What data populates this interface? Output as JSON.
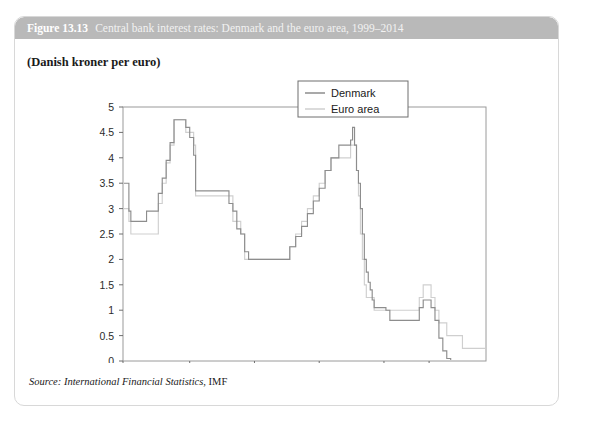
{
  "figure": {
    "number": "Figure 13.13",
    "caption": "Central bank interest rates: Denmark and the euro area, 1999–2014",
    "subtitle": "(Danish kroner per euro)",
    "header_bg": "#b9b9b9"
  },
  "source": {
    "label": "Source:",
    "title": "International Financial Statistics",
    "org": ", IMF"
  },
  "legend": {
    "position": "top-right",
    "entries": [
      {
        "name": "Denmark",
        "color": "#8d8d8d"
      },
      {
        "name": "Euro area",
        "color": "#cfcfcf"
      }
    ]
  },
  "chart_data": {
    "type": "line",
    "title": "Central bank interest rates: Denmark and the euro area, 1999–2014",
    "subtitle": "(Danish kroner per euro)",
    "xlabel": "",
    "ylabel": "",
    "ylim": [
      0,
      5
    ],
    "yticks": [
      "0",
      "0.5",
      "1",
      "1.5",
      "2",
      "2.5",
      "3",
      "3.5",
      "4",
      "4.5",
      "5"
    ],
    "ytick_values": [
      0,
      0.5,
      1,
      1.5,
      2,
      2.5,
      3,
      3.5,
      4,
      4.5,
      5
    ],
    "xticks": [
      "1999M1",
      "2001M11",
      "2004M8",
      "2007M5",
      "2010M2",
      "2012"
    ],
    "xtick_positions": [
      0,
      34,
      67,
      100,
      133,
      156
    ],
    "xlim": [
      0,
      185
    ],
    "grid": false,
    "step_style": "post",
    "series": [
      {
        "name": "Denmark",
        "color": "#8d8d8d",
        "points": [
          [
            0,
            3.5
          ],
          [
            2,
            3.5
          ],
          [
            3,
            2.95
          ],
          [
            4,
            2.75
          ],
          [
            11,
            2.75
          ],
          [
            12,
            2.95
          ],
          [
            17,
            2.95
          ],
          [
            18,
            3.3
          ],
          [
            20,
            3.6
          ],
          [
            22,
            3.95
          ],
          [
            24,
            4.3
          ],
          [
            26,
            4.75
          ],
          [
            31,
            4.75
          ],
          [
            32,
            4.6
          ],
          [
            34,
            4.4
          ],
          [
            36,
            4.05
          ],
          [
            37,
            3.35
          ],
          [
            44,
            3.35
          ],
          [
            52,
            3.35
          ],
          [
            54,
            3.1
          ],
          [
            56,
            2.95
          ],
          [
            58,
            2.6
          ],
          [
            60,
            2.5
          ],
          [
            62,
            2.15
          ],
          [
            64,
            2.0
          ],
          [
            84,
            2.0
          ],
          [
            85,
            2.25
          ],
          [
            88,
            2.45
          ],
          [
            91,
            2.65
          ],
          [
            94,
            2.9
          ],
          [
            97,
            3.15
          ],
          [
            100,
            3.4
          ],
          [
            103,
            3.75
          ],
          [
            106,
            4.0
          ],
          [
            110,
            4.25
          ],
          [
            112,
            4.25
          ],
          [
            116,
            4.35
          ],
          [
            117,
            4.6
          ],
          [
            118,
            4.25
          ],
          [
            119,
            3.75
          ],
          [
            120,
            3.5
          ],
          [
            121,
            3.0
          ],
          [
            122,
            2.5
          ],
          [
            123,
            2.0
          ],
          [
            124,
            1.75
          ],
          [
            125,
            1.55
          ],
          [
            126,
            1.4
          ],
          [
            127,
            1.2
          ],
          [
            128,
            1.05
          ],
          [
            132,
            1.05
          ],
          [
            134,
            1.0
          ],
          [
            136,
            0.8
          ],
          [
            148,
            0.8
          ],
          [
            151,
            1.05
          ],
          [
            153,
            1.2
          ],
          [
            155,
            1.2
          ],
          [
            157,
            1.05
          ],
          [
            159,
            0.8
          ],
          [
            161,
            0.45
          ],
          [
            163,
            0.2
          ],
          [
            165,
            0.05
          ],
          [
            167,
            -0.05
          ],
          [
            185,
            -0.05
          ]
        ]
      },
      {
        "name": "Euro area",
        "color": "#cfcfcf",
        "points": [
          [
            0,
            3.0
          ],
          [
            2,
            3.0
          ],
          [
            3,
            2.75
          ],
          [
            4,
            2.5
          ],
          [
            11,
            2.5
          ],
          [
            12,
            2.5
          ],
          [
            17,
            2.5
          ],
          [
            18,
            3.1
          ],
          [
            20,
            3.5
          ],
          [
            22,
            3.9
          ],
          [
            24,
            4.25
          ],
          [
            26,
            4.75
          ],
          [
            31,
            4.75
          ],
          [
            32,
            4.5
          ],
          [
            34,
            4.5
          ],
          [
            36,
            4.25
          ],
          [
            37,
            3.25
          ],
          [
            44,
            3.25
          ],
          [
            52,
            3.25
          ],
          [
            54,
            3.25
          ],
          [
            56,
            2.75
          ],
          [
            58,
            2.75
          ],
          [
            60,
            2.5
          ],
          [
            62,
            2.0
          ],
          [
            64,
            2.0
          ],
          [
            84,
            2.0
          ],
          [
            85,
            2.25
          ],
          [
            88,
            2.5
          ],
          [
            91,
            2.75
          ],
          [
            94,
            3.0
          ],
          [
            97,
            3.25
          ],
          [
            100,
            3.5
          ],
          [
            103,
            3.75
          ],
          [
            106,
            4.0
          ],
          [
            110,
            4.0
          ],
          [
            112,
            4.0
          ],
          [
            116,
            4.25
          ],
          [
            117,
            4.25
          ],
          [
            118,
            4.25
          ],
          [
            119,
            3.75
          ],
          [
            120,
            3.25
          ],
          [
            121,
            2.5
          ],
          [
            122,
            2.0
          ],
          [
            123,
            1.5
          ],
          [
            124,
            1.25
          ],
          [
            125,
            1.25
          ],
          [
            126,
            1.25
          ],
          [
            127,
            1.25
          ],
          [
            128,
            1.0
          ],
          [
            132,
            1.0
          ],
          [
            134,
            1.0
          ],
          [
            136,
            1.0
          ],
          [
            148,
            1.0
          ],
          [
            151,
            1.25
          ],
          [
            153,
            1.5
          ],
          [
            155,
            1.5
          ],
          [
            157,
            1.25
          ],
          [
            159,
            1.0
          ],
          [
            161,
            0.75
          ],
          [
            163,
            0.75
          ],
          [
            165,
            0.5
          ],
          [
            170,
            0.5
          ],
          [
            173,
            0.25
          ],
          [
            185,
            0.25
          ]
        ]
      }
    ]
  }
}
